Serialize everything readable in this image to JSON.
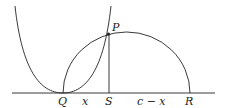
{
  "diagram": {
    "labels": {
      "P": "P",
      "Q": "Q",
      "S": "S",
      "R": "R",
      "x": "x",
      "c_minus_x": "c − x"
    },
    "colors": {
      "stroke": "#222222",
      "background": "#ffffff"
    }
  }
}
